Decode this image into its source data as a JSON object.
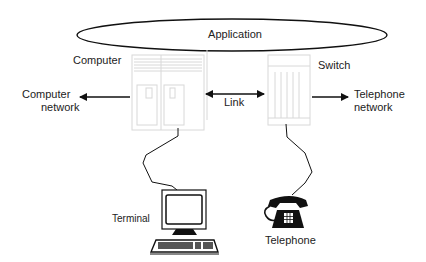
{
  "diagram": {
    "nodes": {
      "application": {
        "label": "Application"
      },
      "computer": {
        "label": "Computer"
      },
      "switch": {
        "label": "Switch"
      },
      "computer_network": {
        "label_line1": "Computer",
        "label_line2": "network"
      },
      "telephone_network": {
        "label_line1": "Telephone",
        "label_line2": "network"
      },
      "terminal": {
        "label": "Terminal"
      },
      "telephone": {
        "label": "Telephone"
      }
    },
    "edges": [
      {
        "from": "computer",
        "to": "computer_network",
        "type": "arrow"
      },
      {
        "from": "computer",
        "to": "switch",
        "type": "bidirectional",
        "label": "Link"
      },
      {
        "from": "switch",
        "to": "telephone_network",
        "type": "arrow"
      },
      {
        "from": "computer",
        "to": "terminal",
        "type": "cable"
      },
      {
        "from": "switch",
        "to": "telephone",
        "type": "cable"
      }
    ],
    "link_label": "Link"
  }
}
